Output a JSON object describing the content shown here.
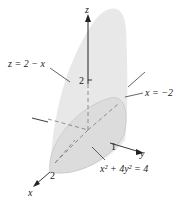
{
  "figure": {
    "axes": {
      "x_label": "x",
      "y_label": "y",
      "z_label": "z",
      "x_tick": "2",
      "y_tick": "1",
      "z_tick": "2"
    },
    "annotations": {
      "plane": "z = 2 − x",
      "plane_edge": "x = −2",
      "ellipse_base": "x² + 4y² = 4"
    },
    "colors": {
      "surface_fill": "#e6e6e6",
      "base_fill": "#d9d9d9",
      "line": "#222222"
    }
  }
}
